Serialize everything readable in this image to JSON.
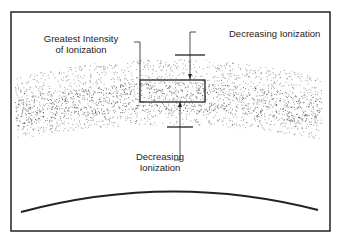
{
  "labels": {
    "greatest_line1": "Greatest Intensity",
    "greatest_line2": "of Ionization",
    "decreasing_top": "Decreasing Ionization",
    "decreasing_bottom_line1": "Decreasing",
    "decreasing_bottom_line2": "Ionization"
  },
  "colors": {
    "line": "#222222",
    "dots": "#333333",
    "background": "#ffffff"
  }
}
